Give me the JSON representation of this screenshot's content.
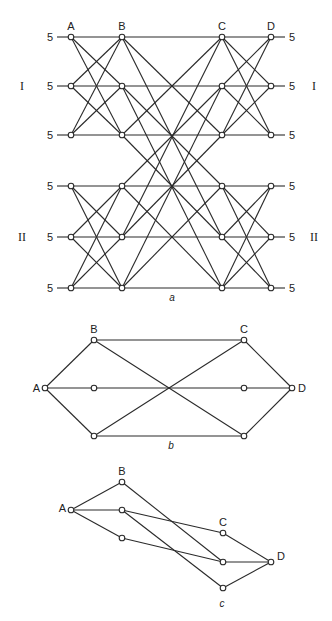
{
  "diagrams": [
    {
      "id": "a",
      "caption": "a",
      "columns": [
        "A",
        "B",
        "C",
        "D"
      ],
      "column_x": [
        71,
        122,
        222,
        271
      ],
      "row_y": [
        37,
        86,
        135,
        186,
        237,
        288
      ],
      "row_capacity": [
        "5",
        "5",
        "5",
        "5",
        "5",
        "5"
      ],
      "groups": [
        {
          "label": "I",
          "rows": [
            0,
            1,
            2
          ]
        },
        {
          "label": "II",
          "rows": [
            3,
            4,
            5
          ]
        }
      ],
      "edges_AB": "complete bipartite within each group",
      "edges_CD": "complete bipartite within each group",
      "edges_BC": [
        [
          0,
          0
        ],
        [
          0,
          2
        ],
        [
          0,
          4
        ],
        [
          1,
          1
        ],
        [
          1,
          3
        ],
        [
          1,
          5
        ],
        [
          2,
          2
        ],
        [
          2,
          0
        ],
        [
          2,
          4
        ],
        [
          3,
          3
        ],
        [
          3,
          1
        ],
        [
          3,
          5
        ],
        [
          4,
          4
        ],
        [
          4,
          0
        ],
        [
          4,
          2
        ],
        [
          5,
          5
        ],
        [
          5,
          1
        ],
        [
          5,
          3
        ]
      ]
    },
    {
      "id": "b",
      "caption": "b",
      "nodes": [
        {
          "id": "A",
          "label": "A",
          "x": 45,
          "y": 388
        },
        {
          "id": "B",
          "label": "B",
          "x": 94,
          "y": 340
        },
        {
          "id": "Bm",
          "label": "",
          "x": 94,
          "y": 388
        },
        {
          "id": "Bb",
          "label": "",
          "x": 94,
          "y": 436
        },
        {
          "id": "C",
          "label": "C",
          "x": 244,
          "y": 340
        },
        {
          "id": "Cm",
          "label": "",
          "x": 244,
          "y": 388
        },
        {
          "id": "Cb",
          "label": "",
          "x": 244,
          "y": 436
        },
        {
          "id": "D",
          "label": "D",
          "x": 292,
          "y": 388
        }
      ],
      "edges": [
        [
          "A",
          "B"
        ],
        [
          "A",
          "Bm"
        ],
        [
          "A",
          "Bb"
        ],
        [
          "B",
          "C"
        ],
        [
          "B",
          "Cb"
        ],
        [
          "Bm",
          "Cm"
        ],
        [
          "Bb",
          "C"
        ],
        [
          "Bb",
          "Cb"
        ],
        [
          "C",
          "D"
        ],
        [
          "Cm",
          "D"
        ],
        [
          "Cb",
          "D"
        ]
      ]
    },
    {
      "id": "c",
      "caption": "c",
      "nodes": [
        {
          "id": "A",
          "label": "A",
          "x": 71,
          "y": 510
        },
        {
          "id": "B",
          "label": "B",
          "x": 122,
          "y": 482
        },
        {
          "id": "Bm",
          "label": "",
          "x": 122,
          "y": 510
        },
        {
          "id": "Bb",
          "label": "",
          "x": 122,
          "y": 538
        },
        {
          "id": "C",
          "label": "C",
          "x": 223,
          "y": 533
        },
        {
          "id": "Cm",
          "label": "",
          "x": 223,
          "y": 562
        },
        {
          "id": "Cb",
          "label": "",
          "x": 223,
          "y": 588
        },
        {
          "id": "D",
          "label": "D",
          "x": 271,
          "y": 562
        }
      ],
      "edges": [
        [
          "A",
          "B"
        ],
        [
          "A",
          "Bm"
        ],
        [
          "A",
          "Bb"
        ],
        [
          "B",
          "Cm"
        ],
        [
          "Bm",
          "C"
        ],
        [
          "Bm",
          "Cb"
        ],
        [
          "Bb",
          "Cm"
        ],
        [
          "C",
          "D"
        ],
        [
          "Cm",
          "D"
        ],
        [
          "Cb",
          "D"
        ]
      ]
    }
  ]
}
